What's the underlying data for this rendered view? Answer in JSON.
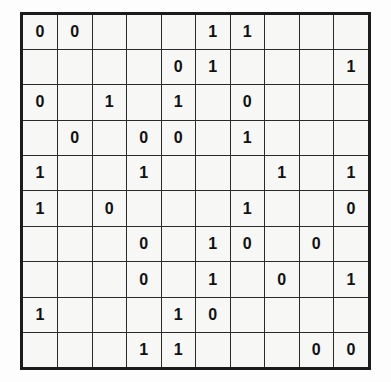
{
  "puzzle": {
    "type": "binary-logic-grid",
    "rows": 10,
    "columns": 10,
    "empty_symbol": "",
    "frame_color": "#1b1b1b",
    "gridline_color": "#2a2a2a",
    "cell_background": "#f7f7f5",
    "digit_color": "#111111",
    "grid": [
      [
        "0",
        "0",
        "",
        "",
        "",
        "1",
        "1",
        "",
        "",
        ""
      ],
      [
        "",
        "",
        "",
        "",
        "0",
        "1",
        "",
        "",
        "",
        "1"
      ],
      [
        "0",
        "",
        "1",
        "",
        "1",
        "",
        "0",
        "",
        "",
        ""
      ],
      [
        "",
        "0",
        "",
        "0",
        "0",
        "",
        "1",
        "",
        "",
        ""
      ],
      [
        "1",
        "",
        "",
        "1",
        "",
        "",
        "",
        "1",
        "",
        "1"
      ],
      [
        "1",
        "",
        "0",
        "",
        "",
        "",
        "1",
        "",
        "",
        "0"
      ],
      [
        "",
        "",
        "",
        "0",
        "",
        "1",
        "0",
        "",
        "0",
        ""
      ],
      [
        "",
        "",
        "",
        "0",
        "",
        "1",
        "",
        "0",
        "",
        "1"
      ],
      [
        "1",
        "",
        "",
        "",
        "1",
        "0",
        "",
        "",
        "",
        ""
      ],
      [
        "",
        "",
        "",
        "1",
        "1",
        "",
        "",
        "",
        "0",
        "0"
      ]
    ]
  }
}
